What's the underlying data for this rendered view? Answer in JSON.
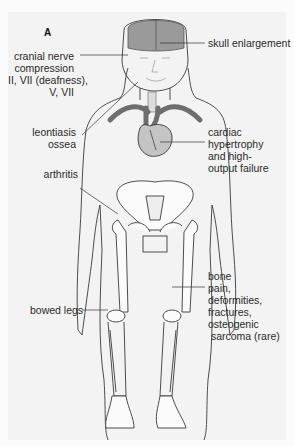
{
  "figure": {
    "panel_label": "A",
    "labels": {
      "skull": "skull enlargement",
      "cranial": "cranial nerve\ncompression\nII, VII (deafness),\nV, VII",
      "leontiasis": "leontiasis\nossea",
      "cardiac": "cardiac\nhypertrophy\nand high-\noutput failure",
      "arthritis": "arthritis",
      "bone": "bone\npain,\ndeformities,\nfractures,\nosteogenic\n sarcoma (rare)",
      "bowed": "bowed legs"
    },
    "colors": {
      "background": "#f3f3f3",
      "outline": "#3a3a3a",
      "brain": "#9a9a9a",
      "vessels": "#6e6e6e",
      "heart": "#c4c4c4",
      "bone_fill": "#fbfbfb"
    }
  }
}
